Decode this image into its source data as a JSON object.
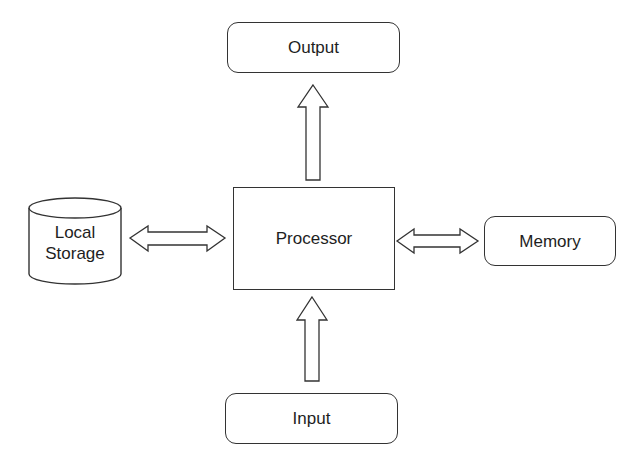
{
  "diagram": {
    "nodes": {
      "output": {
        "label": "Output",
        "shape": "rounded-rectangle"
      },
      "processor": {
        "label": "Processor",
        "shape": "rectangle"
      },
      "memory": {
        "label": "Memory",
        "shape": "rounded-rectangle"
      },
      "input": {
        "label": "Input",
        "shape": "rounded-rectangle"
      },
      "local_storage": {
        "label": "Local\nStorage",
        "shape": "cylinder"
      }
    },
    "edges": [
      {
        "from": "processor",
        "to": "output",
        "type": "single-arrow",
        "direction": "up"
      },
      {
        "from": "input",
        "to": "processor",
        "type": "single-arrow",
        "direction": "up"
      },
      {
        "from": "local_storage",
        "to": "processor",
        "type": "double-arrow"
      },
      {
        "from": "processor",
        "to": "memory",
        "type": "double-arrow"
      }
    ],
    "colors": {
      "stroke": "#333333",
      "text": "#1e1e1e",
      "background": "#ffffff"
    }
  }
}
